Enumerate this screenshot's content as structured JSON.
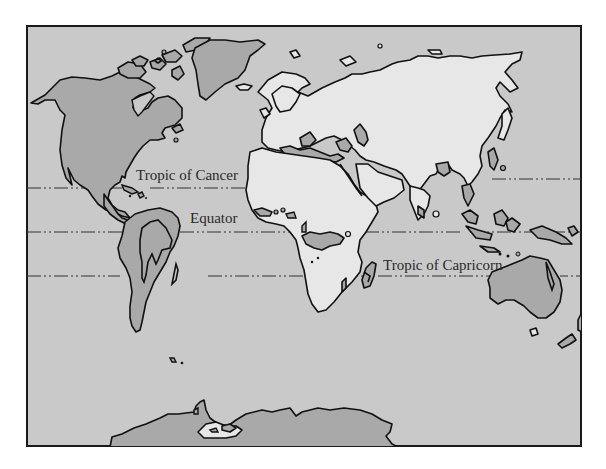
{
  "map": {
    "title": "",
    "type": "world-map",
    "colors": {
      "ocean": "#c9c9c9",
      "land_dark": "#a9a9a9",
      "land_light": "#e7e7e7",
      "outline": "#111111",
      "frame": "#1a1a1a",
      "page": "#ffffff"
    },
    "reference_lines": [
      {
        "name": "Tropic of Cancer",
        "label": "Tropic of Cancer",
        "style": "dash-dot"
      },
      {
        "name": "Equator",
        "label": "Equator",
        "style": "dash-dot"
      },
      {
        "name": "Tropic of Capricorn",
        "label": "Tropic of Capricorn",
        "style": "dash-dot"
      }
    ],
    "regions": [
      {
        "name": "North America",
        "shading": "dark"
      },
      {
        "name": "Greenland",
        "shading": "dark"
      },
      {
        "name": "South America",
        "shading": "dark"
      },
      {
        "name": "Europe",
        "shading": "light"
      },
      {
        "name": "Asia",
        "shading": "light"
      },
      {
        "name": "Africa",
        "shading": "light"
      },
      {
        "name": "Australia",
        "shading": "dark"
      },
      {
        "name": "Antarctica",
        "shading": "dark"
      }
    ]
  }
}
